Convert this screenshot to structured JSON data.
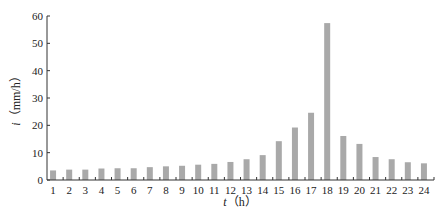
{
  "chart_data": {
    "type": "bar",
    "title": "",
    "xlabel": "t（h）",
    "ylabel": "i（mm/h）",
    "xlabel_var": "t",
    "xlabel_unit": "（h）",
    "ylabel_var": "i",
    "ylabel_unit": "（mm/h）",
    "categories": [
      "1",
      "2",
      "3",
      "4",
      "5",
      "6",
      "7",
      "8",
      "9",
      "10",
      "11",
      "12",
      "13",
      "14",
      "15",
      "16",
      "17",
      "18",
      "19",
      "20",
      "21",
      "22",
      "23",
      "24"
    ],
    "values": [
      3.5,
      3.8,
      3.8,
      4.2,
      4.3,
      4.3,
      4.7,
      5.0,
      5.2,
      5.6,
      5.9,
      6.6,
      7.6,
      9.1,
      14.2,
      19.2,
      24.6,
      57.4,
      16.1,
      13.2,
      8.4,
      7.6,
      6.5,
      6.1
    ],
    "ylim": [
      0,
      60
    ],
    "yticks": [
      0,
      10,
      20,
      30,
      40,
      50,
      60
    ],
    "grid": false,
    "legend": null,
    "bar_color": "#a9a9a9"
  }
}
